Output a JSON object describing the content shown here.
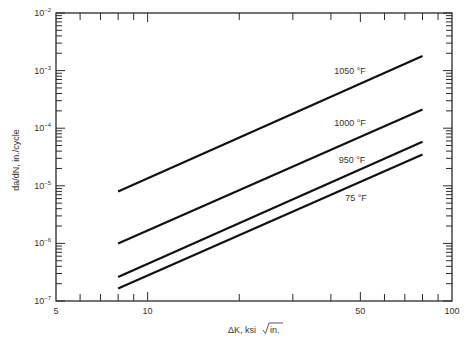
{
  "chart_data": {
    "type": "line",
    "title": "",
    "xlabel": "ΔK, ksi √in.",
    "xlabel_prefix": "ΔK, ksi ",
    "xlabel_radicand": "in.",
    "ylabel": "da/dN, in./cycle",
    "xscale": "log",
    "yscale": "log",
    "xlim": [
      5,
      100
    ],
    "ylim": [
      1e-07,
      0.01
    ],
    "x_tick_labels": [
      {
        "value": 5,
        "label": "5"
      },
      {
        "value": 10,
        "label": "10"
      },
      {
        "value": 50,
        "label": "50"
      },
      {
        "value": 100,
        "label": "100"
      }
    ],
    "x_minor_ticks": [
      6,
      7,
      8,
      9,
      20,
      30,
      40,
      60,
      70,
      80,
      90
    ],
    "y_tick_labels": [
      {
        "value": 0.01,
        "base": "10",
        "exp": "-2"
      },
      {
        "value": 0.001,
        "base": "10",
        "exp": "-3"
      },
      {
        "value": 0.0001,
        "base": "10",
        "exp": "-4"
      },
      {
        "value": 1e-05,
        "base": "10",
        "exp": "-5"
      },
      {
        "value": 1e-06,
        "base": "10",
        "exp": "-6"
      },
      {
        "value": 1e-07,
        "base": "10",
        "exp": "-7"
      }
    ],
    "grid": false,
    "legend": "inline labels",
    "series": [
      {
        "name": "1050 °F",
        "x": [
          8,
          80
        ],
        "y": [
          8e-06,
          0.0018
        ],
        "label_pos": [
          350,
          71
        ]
      },
      {
        "name": "1000 °F",
        "x": [
          8,
          80
        ],
        "y": [
          1e-06,
          0.00021
        ],
        "label_pos": [
          350,
          123
        ]
      },
      {
        "name": "950 °F",
        "x": [
          8,
          80
        ],
        "y": [
          2.6e-07,
          5.8e-05
        ],
        "label_pos": [
          352,
          160
        ]
      },
      {
        "name": "75 °F",
        "x": [
          8,
          80
        ],
        "y": [
          1.65e-07,
          3.5e-05
        ],
        "label_pos": [
          356,
          198
        ]
      }
    ],
    "colors": {
      "line": "#111111",
      "axis": "#2a2a2a",
      "text": "#333333"
    }
  }
}
